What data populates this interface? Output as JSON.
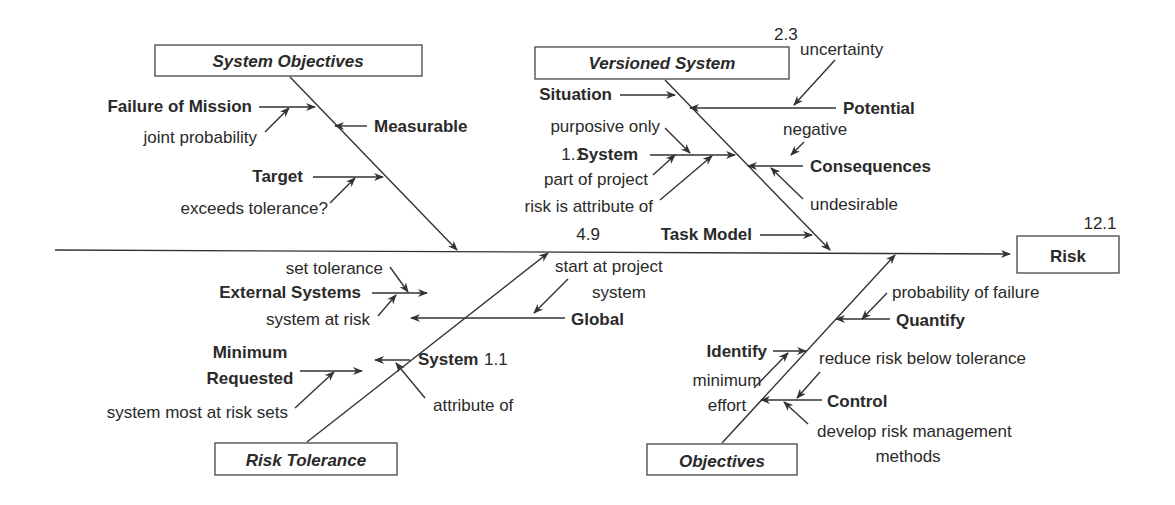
{
  "diagram": {
    "type": "fishbone",
    "effect": {
      "label": "Risk",
      "ref": "12.1"
    },
    "categories": {
      "system_objectives": {
        "label": "System Objectives",
        "causes": [
          {
            "label": "Failure of Mission",
            "note": "joint probability"
          },
          {
            "label": "Measurable"
          },
          {
            "label": "Target",
            "note": "exceeds tolerance?"
          }
        ]
      },
      "versioned_system": {
        "label": "Versioned System",
        "ref": "2.3",
        "causes": [
          {
            "label": "Situation"
          },
          {
            "label": "Potential",
            "note": "uncertainty"
          },
          {
            "label": "System",
            "ref": "1.1",
            "notes": [
              "purposive only",
              "part of project",
              "risk is attribute of"
            ]
          },
          {
            "label": "Consequences",
            "notes": [
              "negative",
              "undesirable"
            ]
          },
          {
            "label": "Task Model",
            "ref": "4.9"
          }
        ]
      },
      "risk_tolerance": {
        "label": "Risk Tolerance",
        "causes": [
          {
            "label": "External Systems",
            "notes": [
              "set tolerance",
              "system at risk"
            ]
          },
          {
            "label": "Global",
            "note_lines": [
              "start at project",
              "system"
            ]
          },
          {
            "label_lines": [
              "Minimum",
              "Requested"
            ],
            "note": "system most at risk sets"
          },
          {
            "label": "System",
            "ref": "1.1",
            "note": "attribute of"
          }
        ]
      },
      "objectives": {
        "label": "Objectives",
        "causes": [
          {
            "label": "Quantify",
            "note": "probability of failure"
          },
          {
            "label": "Identify",
            "note_lines": [
              "minimum",
              "effort"
            ]
          },
          {
            "label": "Control",
            "notes": [
              "reduce risk below tolerance"
            ],
            "note_lines": [
              "develop risk management",
              "methods"
            ]
          }
        ]
      }
    }
  }
}
